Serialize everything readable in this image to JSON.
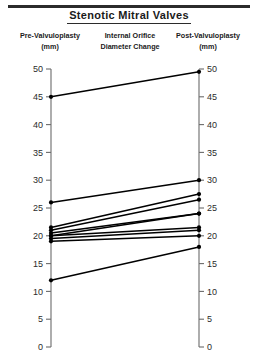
{
  "figure": {
    "title": "Stenotic  Mitral  Valves",
    "headers": {
      "left_line1": "Pre-Valvuloplasty",
      "left_line2": "(mm)",
      "mid_line1": "Internal Orifice",
      "mid_line2": "Diameter Change",
      "right_line1": "Post-Valvuloplasty",
      "right_line2": "(mm)"
    }
  },
  "chart_data": {
    "type": "line",
    "subtype": "slope-graph-paired-before-after",
    "title": "Stenotic  Mitral  Valves",
    "subtitle": "Internal Orifice Diameter Change",
    "xlabel": "",
    "ylabel": "Internal orifice diameter (mm)",
    "categories": [
      "Pre-Valvuloplasty",
      "Post-Valvuloplasty"
    ],
    "left_axis": {
      "label": "Pre-Valvuloplasty (mm)",
      "ylim": [
        0,
        50
      ],
      "ticks": [
        0,
        5,
        10,
        15,
        20,
        25,
        30,
        35,
        40,
        45,
        50
      ],
      "tick_labels": [
        "0",
        "5",
        "10",
        "15",
        "20",
        "25",
        "30",
        "35",
        "40",
        "45",
        "50"
      ]
    },
    "right_axis": {
      "label": "Post-Valvuloplasty (mm)",
      "ylim": [
        0,
        50
      ],
      "ticks": [
        0,
        5,
        10,
        15,
        20,
        25,
        30,
        35,
        40,
        45,
        50
      ],
      "tick_labels": [
        "0",
        "5",
        "10",
        "15",
        "20",
        "25",
        "30",
        "35",
        "40",
        "45",
        "50"
      ]
    },
    "grid": false,
    "legend": "none",
    "n_series": 10,
    "series": [
      {
        "name": "patient-1",
        "pre": 45.0,
        "post": 49.5
      },
      {
        "name": "patient-2",
        "pre": 26.0,
        "post": 30.0
      },
      {
        "name": "patient-3",
        "pre": 21.5,
        "post": 27.5
      },
      {
        "name": "patient-4",
        "pre": 21.0,
        "post": 26.5
      },
      {
        "name": "patient-5",
        "pre": 20.5,
        "post": 24.0
      },
      {
        "name": "patient-6",
        "pre": 20.0,
        "post": 24.0
      },
      {
        "name": "patient-7",
        "pre": 20.0,
        "post": 21.5
      },
      {
        "name": "patient-8",
        "pre": 19.5,
        "post": 21.0
      },
      {
        "name": "patient-9",
        "pre": 19.0,
        "post": 20.0
      },
      {
        "name": "patient-10",
        "pre": 12.0,
        "post": 18.0
      }
    ],
    "marker": "filled-circle",
    "line_color": "#000000"
  }
}
